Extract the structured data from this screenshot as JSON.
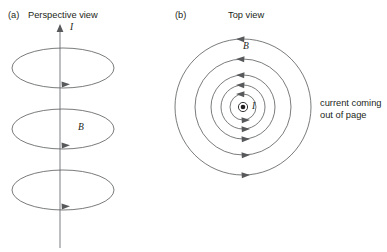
{
  "figure": {
    "width": 387,
    "height": 252,
    "background": "#ffffff",
    "line_color": "#58595b",
    "wire_color": "#a7a9ac",
    "text_color": "#231f20"
  },
  "panel_a": {
    "label": "(a)",
    "title": "Perspective view",
    "current_symbol": "I",
    "field_symbol": "B",
    "wire": {
      "x": 60,
      "top_y": 26,
      "bottom_y": 248,
      "arrow_direction": "up"
    },
    "loops": [
      {
        "cx": 63,
        "cy": 68,
        "rx": 51,
        "ry": 20
      },
      {
        "cx": 63,
        "cy": 129,
        "rx": 51,
        "ry": 20
      },
      {
        "cx": 63,
        "cy": 190,
        "rx": 51,
        "ry": 20
      }
    ],
    "loop_arrow_direction": "right"
  },
  "panel_b": {
    "label": "(b)",
    "title": "Top view",
    "current_symbol": "I",
    "field_symbol": "B",
    "center": {
      "x": 243,
      "y": 107
    },
    "circle_radii": [
      13,
      22,
      32,
      48,
      68
    ],
    "circulation": "counterclockwise",
    "top_arrow_direction": "left",
    "bottom_arrow_direction": "right",
    "current_marker": "dot-in-circle",
    "caption_lines": [
      "current coming",
      "out of page"
    ]
  }
}
